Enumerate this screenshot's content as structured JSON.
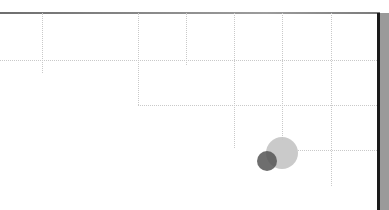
{
  "diagram": {
    "frame": {
      "top_border_color": "#808080",
      "right_edge_dark": "#1a1a1a",
      "right_edge_bar": "#9a9a9a"
    },
    "grid_color": "#c9c9c9",
    "vertical_lines": [
      {
        "x": 42,
        "y1": 13,
        "y2": 73
      },
      {
        "x": 138,
        "y1": 13,
        "y2": 105
      },
      {
        "x": 186,
        "y1": 13,
        "y2": 65
      },
      {
        "x": 234,
        "y1": 13,
        "y2": 148
      },
      {
        "x": 282,
        "y1": 13,
        "y2": 140
      },
      {
        "x": 331,
        "y1": 13,
        "y2": 186
      }
    ],
    "horizontal_lines": [
      {
        "y": 60,
        "x1": 0,
        "x2": 377
      },
      {
        "y": 105,
        "x1": 138,
        "x2": 377
      },
      {
        "y": 150,
        "x1": 298,
        "x2": 377
      }
    ],
    "circles": [
      {
        "name": "large-circle",
        "cx": 282,
        "cy": 153,
        "r": 16,
        "color": "#c4c4c4"
      },
      {
        "name": "small-circle",
        "cx": 267,
        "cy": 161,
        "r": 10,
        "color": "#5e5e5e"
      }
    ]
  }
}
